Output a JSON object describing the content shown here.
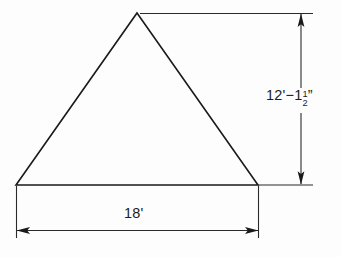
{
  "drawing": {
    "title": "Triangle with dimensions",
    "background_color": "#fdfdfd",
    "line_color": "#1a1a1a",
    "shape": {
      "name": "triangle",
      "apex": [
        137,
        13
      ],
      "left_vertex": [
        16,
        185
      ],
      "right_vertex": [
        258,
        185
      ]
    },
    "dimensions": {
      "height": {
        "orientation": "vertical",
        "feet": "12'",
        "separator": "−",
        "whole_inches": "1",
        "fraction_numerator": "1",
        "fraction_denominator": "2",
        "inch_mark": "”",
        "full_text": "12'−1 1/2”"
      },
      "base": {
        "orientation": "horizontal",
        "full_text": "18'"
      }
    }
  }
}
